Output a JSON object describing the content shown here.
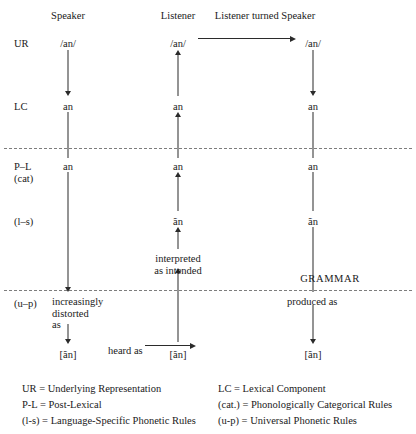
{
  "diagram": {
    "column_headers": [
      {
        "label": "Speaker",
        "x": 68,
        "y": 10
      },
      {
        "label": "Listener",
        "x": 178,
        "y": 10
      },
      {
        "label": "Listener turned Speaker",
        "x": 265,
        "y": 10
      }
    ],
    "row_labels": [
      {
        "label": "UR",
        "x": 14,
        "y": 38
      },
      {
        "label": "LC",
        "x": 14,
        "y": 101
      },
      {
        "label": "P–L",
        "x": 14,
        "y": 161
      },
      {
        "label": "(cat)",
        "x": 14,
        "y": 173
      },
      {
        "label": "(l–s)",
        "x": 14,
        "y": 216
      },
      {
        "label": "(u–p)",
        "x": 14,
        "y": 298
      }
    ],
    "nodes": [
      {
        "text": "/an/",
        "x": 68,
        "y": 38,
        "name": "speaker-ur"
      },
      {
        "text": "an",
        "x": 68,
        "y": 101,
        "name": "speaker-lc"
      },
      {
        "text": "an",
        "x": 68,
        "y": 161,
        "name": "speaker-pl"
      },
      {
        "text": "[ãn]",
        "x": 68,
        "y": 349,
        "name": "speaker-output"
      },
      {
        "text": "/an/",
        "x": 178,
        "y": 38,
        "name": "listener-ur"
      },
      {
        "text": "an",
        "x": 178,
        "y": 101,
        "name": "listener-lc"
      },
      {
        "text": "an",
        "x": 178,
        "y": 161,
        "name": "listener-pl"
      },
      {
        "text": "ãn",
        "x": 178,
        "y": 216,
        "name": "listener-ls"
      },
      {
        "text": "[ãn]",
        "x": 178,
        "y": 349,
        "name": "listener-input"
      },
      {
        "text": "/an/",
        "x": 313,
        "y": 38,
        "name": "turned-speaker-ur"
      },
      {
        "text": "an",
        "x": 313,
        "y": 101,
        "name": "turned-speaker-lc"
      },
      {
        "text": "an",
        "x": 313,
        "y": 161,
        "name": "turned-speaker-pl"
      },
      {
        "text": "ãn",
        "x": 313,
        "y": 216,
        "name": "turned-speaker-ls"
      },
      {
        "text": "[ãn]",
        "x": 313,
        "y": 349,
        "name": "turned-speaker-output"
      }
    ],
    "notes": {
      "speaker_distortion_lines": [
        "increasingly",
        "distorted",
        "as"
      ],
      "speaker_distortion_x": 52,
      "speaker_distortion_y": 296,
      "heard_as": "heard as",
      "heard_as_x": 108,
      "heard_as_y": 345,
      "interpreted_lines": [
        "interpreted",
        "as intended"
      ],
      "interpreted_x": 178,
      "interpreted_y": 253,
      "produced_as": "produced as",
      "produced_as_x": 287,
      "produced_as_y": 296,
      "grammar": "GRAMMAR",
      "grammar_x": 330,
      "grammar_y": 273
    },
    "dividers": [
      {
        "y": 148,
        "x": 4,
        "width": 408,
        "name": "upper-dashed-divider"
      },
      {
        "y": 290,
        "x": 4,
        "width": 408,
        "name": "lower-dashed-divider"
      }
    ],
    "connectors": [
      {
        "name": "speaker-ur-to-lc",
        "type": "vertical-down",
        "x": 68,
        "y1": 50,
        "y2": 96
      },
      {
        "name": "speaker-lc-to-pl",
        "type": "vertical-plain",
        "x": 68,
        "y1": 112,
        "y2": 158
      },
      {
        "name": "speaker-pl-to-up",
        "type": "vertical-down",
        "x": 68,
        "y1": 172,
        "y2": 292
      },
      {
        "name": "speaker-note-to-output",
        "type": "vertical-down",
        "x": 68,
        "y1": 324,
        "y2": 344
      },
      {
        "name": "listener-input-to-interpreted",
        "type": "vertical-up",
        "x": 178,
        "y1": 268,
        "y2": 342
      },
      {
        "name": "listener-interpreted-to-ls",
        "type": "vertical-up",
        "x": 178,
        "y1": 227,
        "y2": 249
      },
      {
        "name": "listener-ls-to-pl",
        "type": "vertical-up",
        "x": 178,
        "y1": 172,
        "y2": 211
      },
      {
        "name": "listener-pl-to-lc",
        "type": "vertical-up",
        "x": 178,
        "y1": 112,
        "y2": 158
      },
      {
        "name": "listener-lc-to-ur",
        "type": "vertical-up",
        "x": 178,
        "y1": 50,
        "y2": 96
      },
      {
        "name": "turned-speaker-ur-to-lc",
        "type": "vertical-down",
        "x": 313,
        "y1": 50,
        "y2": 96
      },
      {
        "name": "turned-speaker-lc-to-pl",
        "type": "vertical-plain",
        "x": 313,
        "y1": 112,
        "y2": 158
      },
      {
        "name": "turned-speaker-pl-to-ls",
        "type": "vertical-plain",
        "x": 313,
        "y1": 172,
        "y2": 211
      },
      {
        "name": "turned-speaker-ls-to-produced",
        "type": "vertical-plain",
        "x": 313,
        "y1": 227,
        "y2": 292
      },
      {
        "name": "turned-speaker-produced-to-output",
        "type": "vertical-down",
        "x": 313,
        "y1": 305,
        "y2": 344
      }
    ],
    "horizontal_connectors": [
      {
        "name": "ur-transfer-arrow",
        "y": 38,
        "x1": 198,
        "x2": 296
      },
      {
        "name": "heard-as-arrow",
        "y": 345,
        "x1": 145,
        "x2": 196
      }
    ]
  },
  "legend": {
    "left_column": [
      "UR = Underlying Representation",
      "P-L = Post-Lexical",
      "(l-s) = Language-Specific Phonetic Rules"
    ],
    "right_column": [
      "LC = Lexical Component",
      "(cat.) = Phonologically Categorical Rules",
      "(u-p) = Universal Phonetic Rules"
    ],
    "left_x": 22,
    "right_x": 218,
    "start_y": 383,
    "line_height": 16
  }
}
